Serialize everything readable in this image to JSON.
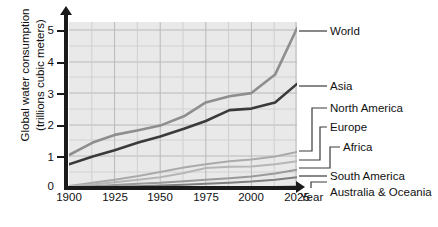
{
  "chart_data": {
    "type": "line",
    "title": "",
    "xlabel": "Year",
    "ylabel": "Global water consumption (trillions cubic meters)",
    "ylabel_line1": "Global water consumption",
    "ylabel_line2": "(trillions cubic meters)",
    "xlim": [
      1900,
      2025
    ],
    "ylim": [
      0,
      5.4
    ],
    "xticks": [
      1900,
      1925,
      1950,
      1975,
      2000,
      2025
    ],
    "xtick_labels": [
      "1900",
      "1925",
      "1950",
      "1975",
      "2000",
      "2025"
    ],
    "yticks": [
      0,
      1,
      2,
      3,
      4,
      5
    ],
    "ytick_labels": [
      "0",
      "1",
      "2",
      "3",
      "4",
      "5"
    ],
    "grid": true,
    "legend_position": "right-inline-labels",
    "x": [
      1900,
      1913,
      1925,
      1938,
      1950,
      1963,
      1975,
      1988,
      2000,
      2013,
      2025
    ],
    "series": [
      {
        "name": "World",
        "color": "#8e8e8e",
        "values": [
          1.1,
          1.5,
          1.75,
          1.9,
          2.05,
          2.35,
          2.8,
          3.0,
          3.1,
          3.7,
          5.2
        ]
      },
      {
        "name": "Asia",
        "color": "#3a3a3a",
        "values": [
          0.8,
          1.05,
          1.25,
          1.5,
          1.7,
          1.95,
          2.2,
          2.55,
          2.6,
          2.8,
          3.4
        ]
      },
      {
        "name": "North America",
        "color": "#aaaaaa",
        "values": [
          0.1,
          0.2,
          0.3,
          0.42,
          0.55,
          0.7,
          0.8,
          0.9,
          0.95,
          1.05,
          1.2
        ]
      },
      {
        "name": "Europe",
        "color": "#b6b6b6",
        "values": [
          0.08,
          0.15,
          0.22,
          0.3,
          0.38,
          0.52,
          0.68,
          0.72,
          0.73,
          0.8,
          0.9
        ]
      },
      {
        "name": "Africa",
        "color": "#9a9a9a",
        "values": [
          0.05,
          0.09,
          0.13,
          0.17,
          0.2,
          0.25,
          0.3,
          0.35,
          0.4,
          0.5,
          0.62
        ]
      },
      {
        "name": "South America",
        "color": "#7e7e7e",
        "values": [
          0.03,
          0.05,
          0.07,
          0.09,
          0.11,
          0.14,
          0.17,
          0.2,
          0.24,
          0.3,
          0.38
        ]
      },
      {
        "name": "Australia & Oceania",
        "color": "#6e6e6e",
        "values": [
          0.01,
          0.012,
          0.015,
          0.018,
          0.02,
          0.025,
          0.03,
          0.035,
          0.04,
          0.05,
          0.06
        ]
      }
    ],
    "series_labels": [
      {
        "name": "World",
        "label": "World"
      },
      {
        "name": "Asia",
        "label": "Asia"
      },
      {
        "name": "North America",
        "label": "North America"
      },
      {
        "name": "Europe",
        "label": "Europe"
      },
      {
        "name": "Africa",
        "label": "Africa"
      },
      {
        "name": "South America",
        "label": "South America"
      },
      {
        "name": "Australia & Oceania",
        "label": "Australia & Oceania"
      }
    ],
    "colors": {
      "plot_background": "#e9e9e9",
      "gridline": "#b9b9b9",
      "axis": "#1a1a1a",
      "text": "#111111"
    }
  }
}
